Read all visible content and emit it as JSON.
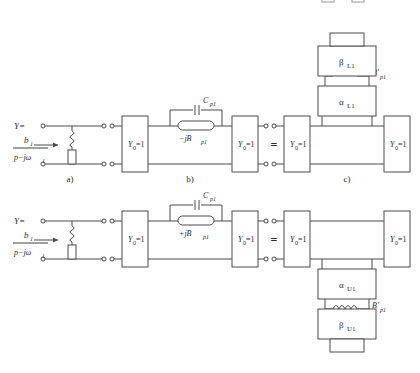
{
  "figure": {
    "type": "circuit-equivalence-diagram",
    "background": "#ffffff",
    "ink": "#4a4a4a"
  },
  "rows": [
    {
      "id": "upper",
      "source": {
        "Y_label": "Y=",
        "numerator": "b",
        "numerator_sub": "1",
        "denominator": "p−jω",
        "denominator_sub": "1",
        "arrow": "→"
      },
      "panel_labels": {
        "a": "a)",
        "b": "b)",
        "c": "c)"
      },
      "boxes": {
        "y0_b_left": "Y",
        "y0_b_left_sub": "0",
        "y0_b_left_val": "=1",
        "y0_b_right": "Y",
        "y0_b_right_sub": "0",
        "y0_b_right_val": "=1",
        "y0_c_left": "Y",
        "y0_c_left_sub": "0",
        "y0_c_left_val": "=1",
        "y0_c_right": "Y",
        "y0_c_right_sub": "0",
        "y0_c_right_val": "=1"
      },
      "shunt": {
        "cap_label": "C",
        "cap_sub": "p1",
        "susceptance": "−jB",
        "susceptance_sub": "p1"
      },
      "equals": "=",
      "stub": {
        "outer": "β",
        "outer_sub": "L1",
        "inner": "α",
        "inner_sub": "L1",
        "coil": "B′",
        "coil_sub": "p1",
        "orientation": "up"
      }
    },
    {
      "id": "lower",
      "source": {
        "Y_label": "Y=",
        "numerator": "b",
        "numerator_sub": "1",
        "denominator": "p−jω",
        "denominator_sub": "1",
        "arrow": "→"
      },
      "panel_labels": {
        "a": "",
        "b": "",
        "c": ""
      },
      "boxes": {
        "y0_b_left": "Y",
        "y0_b_left_sub": "0",
        "y0_b_left_val": "=1",
        "y0_b_right": "Y",
        "y0_b_right_sub": "0",
        "y0_b_right_val": "=1",
        "y0_c_left": "Y",
        "y0_c_left_sub": "0",
        "y0_c_left_val": "=1",
        "y0_c_right": "Y",
        "y0_c_right_sub": "0",
        "y0_c_right_val": "=1"
      },
      "shunt": {
        "cap_label": "C",
        "cap_sub": "p1",
        "susceptance": "+jB",
        "susceptance_sub": "p1"
      },
      "equals": "=",
      "stub": {
        "outer": "β",
        "outer_sub": "U1",
        "inner": "α",
        "inner_sub": "U1",
        "coil": "B′",
        "coil_sub": "p1",
        "orientation": "down"
      }
    }
  ]
}
